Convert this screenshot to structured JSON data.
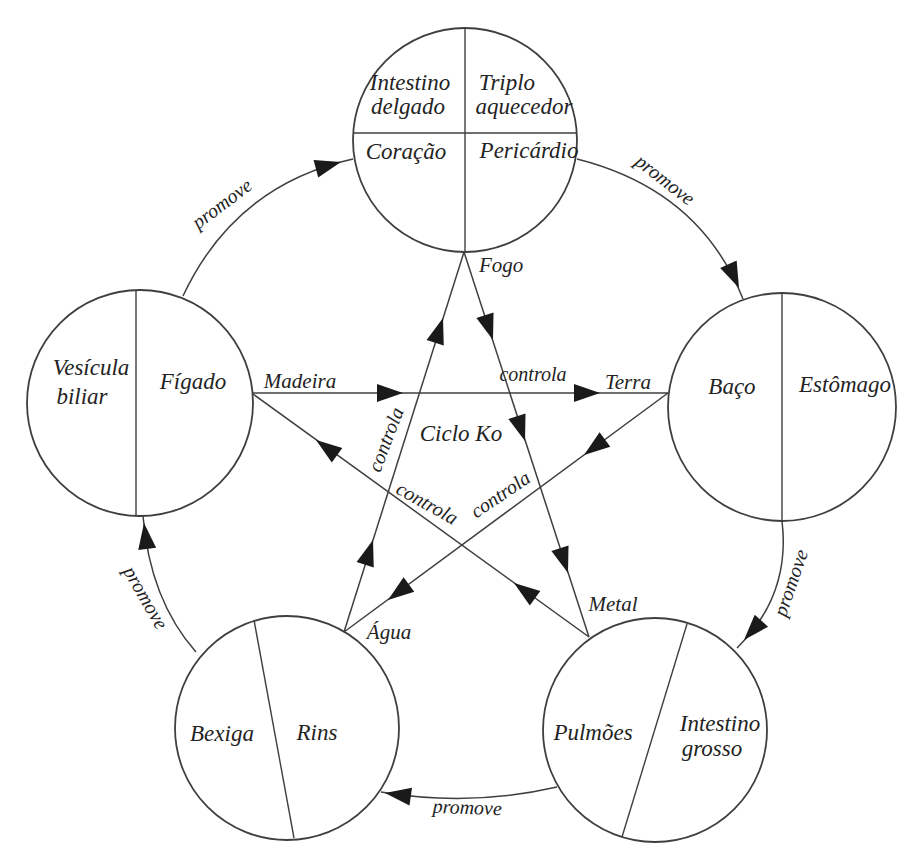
{
  "figure": {
    "center_label": "Ciclo Ko",
    "promote_label": "promove",
    "control_label": "controla",
    "elements": {
      "fire": "Fogo",
      "wood": "Madeira",
      "earth": "Terra",
      "water": "Água",
      "metal": "Metal"
    },
    "organs": {
      "fire": {
        "q1a": "Intestino",
        "q1b": "delgado",
        "q2a": "Triplo",
        "q2b": "aquecedor",
        "q3": "Coração",
        "q4": "Pericárdio"
      },
      "wood": {
        "left_a": "Vesícula",
        "left_b": "biliar",
        "right": "Fígado"
      },
      "earth": {
        "left": "Baço",
        "right": "Estômago"
      },
      "water": {
        "left": "Bexiga",
        "right": "Rins"
      },
      "metal": {
        "left": "Pulmões",
        "right_a": "Intestino",
        "right_b": "grosso"
      }
    },
    "cycles": {
      "promove_sequence": [
        "Madeira → Fogo",
        "Fogo → Terra",
        "Terra → Metal",
        "Metal → Água",
        "Água → Madeira"
      ],
      "controla_sequence": [
        "Madeira → Terra",
        "Fogo → Metal",
        "Terra → Água",
        "Água → Fogo",
        "Metal → Madeira"
      ]
    },
    "colors": {
      "line": "#3f3f3f",
      "arrow": "#1a1a1a",
      "text": "#232323",
      "background": "#ffffff"
    }
  }
}
